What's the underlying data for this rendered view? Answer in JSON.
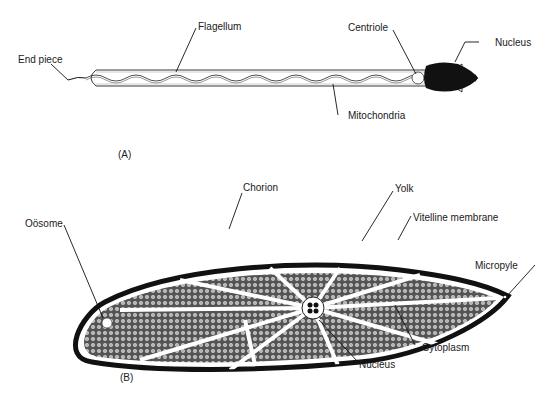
{
  "panel_a": {
    "label": "(A)",
    "title": "Sperm",
    "labels": {
      "end_piece": "End piece",
      "flagellum": "Flagellum",
      "centriole": "Centriole",
      "nucleus": "Nucleus",
      "mitochondria": "Mitochondria"
    }
  },
  "panel_b": {
    "label": "(B)",
    "title": "Egg",
    "labels": {
      "oosome": "Oösome",
      "chorion": "Chorion",
      "yolk": "Yolk",
      "vitelline_membrane": "Vitelline membrane",
      "micropyle": "Micropyle",
      "cytoplasm": "Cytoplasm",
      "nucleus": "Nucleus"
    }
  },
  "colors": {
    "ink": "#111111",
    "yolk_fill": "#8a8a8a",
    "background": "#ffffff"
  }
}
